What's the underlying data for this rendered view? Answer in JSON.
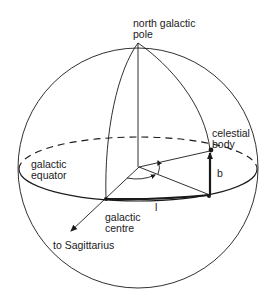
{
  "diagram": {
    "labels": {
      "north_pole_line1": "north galactic",
      "north_pole_line2": "pole",
      "celestial_line1": "celestial",
      "celestial_line2": "body",
      "equator_line1": "galactic",
      "equator_line2": "equator",
      "centre_line1": "galactic",
      "centre_line2": "centre",
      "sagittarius": "to Sagittarius",
      "latitude": "b",
      "longitude": "l"
    },
    "colors": {
      "line": "#1a1a1a",
      "background": "#ffffff"
    }
  }
}
